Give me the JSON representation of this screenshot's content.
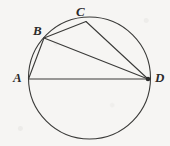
{
  "figure": {
    "type": "geometry-diagram",
    "background_color": "#f6f5f3",
    "stroke_color": "#3a3a38",
    "label_color": "#2b2b2b",
    "width": 170,
    "height": 146,
    "circle": {
      "cx": 89.5,
      "cy": 78.0,
      "r": 61.0
    },
    "points": [
      {
        "name": "A",
        "x": 28.5,
        "y": 79.0,
        "label": "A",
        "label_x": 13,
        "label_y": 71,
        "marked": false
      },
      {
        "name": "B",
        "x": 44.0,
        "y": 38.0,
        "label": "B",
        "label_x": 33,
        "label_y": 24,
        "marked": false
      },
      {
        "name": "C",
        "x": 86.0,
        "y": 21.5,
        "label": "C",
        "label_x": 76,
        "label_y": 5,
        "marked": false
      },
      {
        "name": "D",
        "x": 148.0,
        "y": 79.0,
        "label": "D",
        "label_x": 155,
        "label_y": 71,
        "marked": true
      }
    ],
    "chords": [
      {
        "name": "AB",
        "from": "A",
        "to": "B"
      },
      {
        "name": "AD",
        "from": "A",
        "to": "D"
      },
      {
        "name": "BC",
        "from": "B",
        "to": "C"
      },
      {
        "name": "BD",
        "from": "B",
        "to": "D"
      },
      {
        "name": "CD",
        "from": "C",
        "to": "D"
      }
    ]
  }
}
